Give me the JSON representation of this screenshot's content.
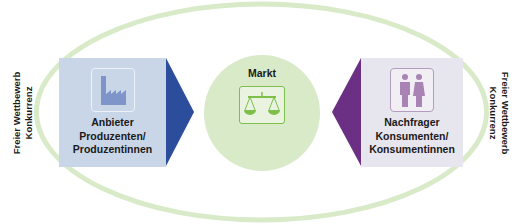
{
  "diagram": {
    "center": {
      "title": "Markt",
      "icon": "scale-icon"
    },
    "left_box": {
      "icon": "factory-icon",
      "lines": [
        "Anbieter",
        "Produzenten/",
        "Produzentinnen"
      ]
    },
    "right_box": {
      "icon": "people-icon",
      "lines": [
        "Nachfrager",
        "Konsumenten/",
        "Konsumentinnen"
      ]
    },
    "left_side_label": {
      "lines": [
        "Freier Wettbewerb",
        "Konkurrenz"
      ]
    },
    "right_side_label": {
      "lines": [
        "Freier Wettbewerb",
        "Konkurrenz"
      ]
    },
    "arrows": [
      {
        "direction": "right",
        "from": "Anbieter",
        "to": "Markt"
      },
      {
        "direction": "left",
        "from": "Nachfrager",
        "to": "Markt"
      }
    ],
    "colors": {
      "ellipse": "#d9eac9",
      "left_box": "#c9d6e8",
      "left_arrow": "#2c4d9c",
      "center_circle": "#d8eac8",
      "scale_icon": "#7dbf4a",
      "right_box": "#e7e5ed",
      "right_arrow": "#6b2f83",
      "people_icon": "#a883b3",
      "factory_icon": "#7f95c9"
    }
  }
}
